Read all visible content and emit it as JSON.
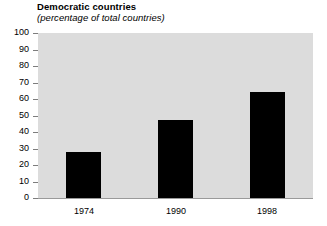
{
  "chart_data": {
    "type": "bar",
    "title": "Democratic countries",
    "subtitle": "(percentage of total countries)",
    "xlabel": "",
    "ylabel": "",
    "categories": [
      "1974",
      "1990",
      "1998"
    ],
    "values": [
      28,
      47,
      64
    ],
    "series": [
      {
        "name": "Democratic countries",
        "values": [
          28,
          47,
          64
        ]
      }
    ],
    "ylim": [
      0,
      100
    ],
    "ytick_labels": [
      "100",
      "90",
      "80",
      "70",
      "60",
      "50",
      "40",
      "30",
      "20",
      "10",
      "0"
    ],
    "ytick_values": [
      100,
      90,
      80,
      70,
      60,
      50,
      40,
      30,
      20,
      10,
      0
    ],
    "grid": false,
    "legend": false,
    "legend_position": "none",
    "bar_color": "#000000",
    "plot_background": "#dcdcdc",
    "figure_background": "#ffffff"
  }
}
